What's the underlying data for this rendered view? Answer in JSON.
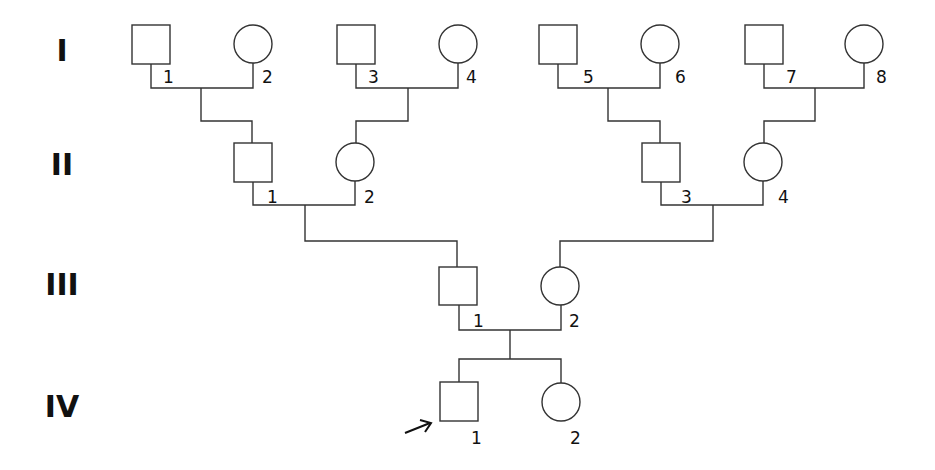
{
  "diagram": {
    "type": "pedigree",
    "colors": {
      "stroke": "#333333",
      "text": "#111111",
      "background": "#ffffff"
    },
    "generations": [
      {
        "id": "I",
        "label": "I"
      },
      {
        "id": "II",
        "label": "II"
      },
      {
        "id": "III",
        "label": "III"
      },
      {
        "id": "IV",
        "label": "IV"
      }
    ],
    "individuals": [
      {
        "id": "I-1",
        "generation": "I",
        "number": "1",
        "sex": "male",
        "affected": false
      },
      {
        "id": "I-2",
        "generation": "I",
        "number": "2",
        "sex": "female",
        "affected": false
      },
      {
        "id": "I-3",
        "generation": "I",
        "number": "3",
        "sex": "male",
        "affected": false
      },
      {
        "id": "I-4",
        "generation": "I",
        "number": "4",
        "sex": "female",
        "affected": false
      },
      {
        "id": "I-5",
        "generation": "I",
        "number": "5",
        "sex": "male",
        "affected": false
      },
      {
        "id": "I-6",
        "generation": "I",
        "number": "6",
        "sex": "female",
        "affected": false
      },
      {
        "id": "I-7",
        "generation": "I",
        "number": "7",
        "sex": "male",
        "affected": false
      },
      {
        "id": "I-8",
        "generation": "I",
        "number": "8",
        "sex": "female",
        "affected": false
      },
      {
        "id": "II-1",
        "generation": "II",
        "number": "1",
        "sex": "male",
        "affected": false
      },
      {
        "id": "II-2",
        "generation": "II",
        "number": "2",
        "sex": "female",
        "affected": false
      },
      {
        "id": "II-3",
        "generation": "II",
        "number": "3",
        "sex": "male",
        "affected": false
      },
      {
        "id": "II-4",
        "generation": "II",
        "number": "4",
        "sex": "female",
        "affected": false
      },
      {
        "id": "III-1",
        "generation": "III",
        "number": "1",
        "sex": "male",
        "affected": false
      },
      {
        "id": "III-2",
        "generation": "III",
        "number": "2",
        "sex": "female",
        "affected": false
      },
      {
        "id": "IV-1",
        "generation": "IV",
        "number": "1",
        "sex": "male",
        "affected": false,
        "proband": true
      },
      {
        "id": "IV-2",
        "generation": "IV",
        "number": "2",
        "sex": "female",
        "affected": false
      }
    ],
    "matings": [
      {
        "partners": [
          "I-1",
          "I-2"
        ],
        "children": [
          "II-1"
        ]
      },
      {
        "partners": [
          "I-3",
          "I-4"
        ],
        "children": [
          "II-2"
        ]
      },
      {
        "partners": [
          "I-5",
          "I-6"
        ],
        "children": [
          "II-3"
        ]
      },
      {
        "partners": [
          "I-7",
          "I-8"
        ],
        "children": [
          "II-4"
        ]
      },
      {
        "partners": [
          "II-1",
          "II-2"
        ],
        "children": [
          "III-1"
        ]
      },
      {
        "partners": [
          "II-3",
          "II-4"
        ],
        "children": [
          "III-2"
        ]
      },
      {
        "partners": [
          "III-1",
          "III-2"
        ],
        "children": [
          "IV-1",
          "IV-2"
        ]
      }
    ],
    "proband": "IV-1"
  }
}
